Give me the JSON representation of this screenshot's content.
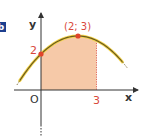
{
  "badge": {
    "label": "b",
    "color": "#1d3f8f"
  },
  "axes": {
    "x_label": "x",
    "y_label": "y",
    "origin_label": "O"
  },
  "points": {
    "y_intercept": {
      "label": "2",
      "x": 0,
      "y": 2
    },
    "vertex": {
      "label": "(2; 3)",
      "x": 2,
      "y": 3
    }
  },
  "x_tick": {
    "label": "3",
    "value": 3
  },
  "curve": {
    "type": "parabola",
    "equation_form": "y = -0.25(x - 2)^2 + 3",
    "a": -0.25,
    "h": 2,
    "k": 3,
    "color": "#6b5a1e",
    "glow_color": "#f3d44a"
  },
  "shaded_region": {
    "from_x": 0,
    "to_x": 3,
    "color": "#f6c9a8"
  },
  "colors": {
    "point": "#e0442c",
    "label_red": "#d9483b",
    "axis": "#333333"
  }
}
